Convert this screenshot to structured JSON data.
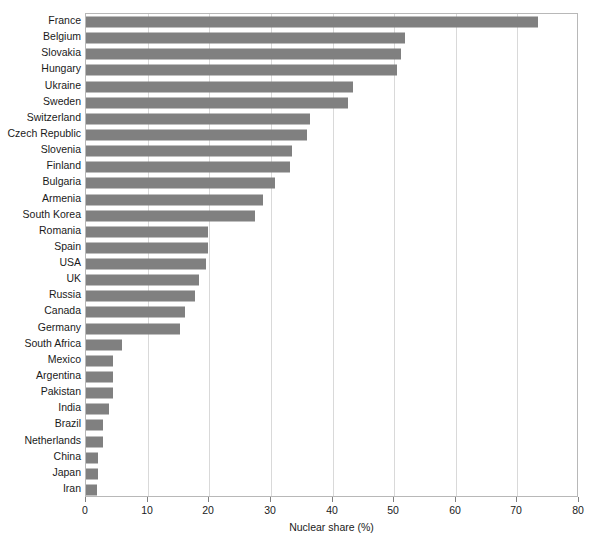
{
  "chart_data": {
    "type": "bar",
    "orientation": "horizontal",
    "title": "",
    "xlabel": "Nuclear share (%)",
    "ylabel": "",
    "xlim": [
      0,
      80
    ],
    "xticks": [
      0,
      10,
      20,
      30,
      40,
      50,
      60,
      70,
      80
    ],
    "grid": true,
    "grid_axis": "x",
    "legend": false,
    "bar_color": "#808080",
    "categories": [
      "France",
      "Belgium",
      "Slovakia",
      "Hungary",
      "Ukraine",
      "Sweden",
      "Switzerland",
      "Czech Republic",
      "Slovenia",
      "Finland",
      "Bulgaria",
      "Armenia",
      "South Korea",
      "Romania",
      "Spain",
      "USA",
      "UK",
      "Russia",
      "Canada",
      "Germany",
      "South Africa",
      "Mexico",
      "Argentina",
      "Pakistan",
      "India",
      "Brazil",
      "Netherlands",
      "China",
      "Japan",
      "Iran"
    ],
    "values": [
      73.3,
      51.7,
      51.1,
      50.4,
      43.4,
      42.5,
      36.4,
      35.9,
      33.4,
      33.1,
      30.7,
      28.7,
      27.4,
      19.8,
      19.8,
      19.5,
      18.3,
      17.7,
      16.1,
      15.3,
      5.8,
      4.4,
      4.4,
      4.4,
      3.7,
      2.8,
      2.8,
      1.9,
      1.9,
      1.8
    ]
  },
  "axis": {
    "x_tick_labels": [
      "0",
      "10",
      "20",
      "30",
      "40",
      "50",
      "60",
      "70",
      "80"
    ],
    "x_title": "Nuclear share (%)"
  }
}
